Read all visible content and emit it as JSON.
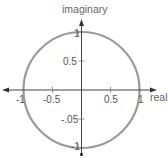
{
  "diagram": {
    "type": "unit-circle-complex-plane",
    "axes": {
      "x_label": "real",
      "y_label": "imaginary"
    },
    "x_ticks": [
      {
        "value": -1,
        "label": "-1"
      },
      {
        "value": -0.5,
        "label": "-0.5"
      },
      {
        "value": 0.5,
        "label": "0.5"
      },
      {
        "value": 1,
        "label": "1"
      }
    ],
    "y_ticks": [
      {
        "value": 1,
        "label": "1"
      },
      {
        "value": 0.5,
        "label": "0.5"
      },
      {
        "value": -0.5,
        "label": "-.05"
      },
      {
        "value": -1,
        "label": "-1"
      }
    ],
    "circle": {
      "center": [
        0,
        0
      ],
      "radius": 1
    },
    "colors": {
      "circle": "#9a9a9a",
      "axes": "#444444",
      "text": "#555555"
    }
  }
}
